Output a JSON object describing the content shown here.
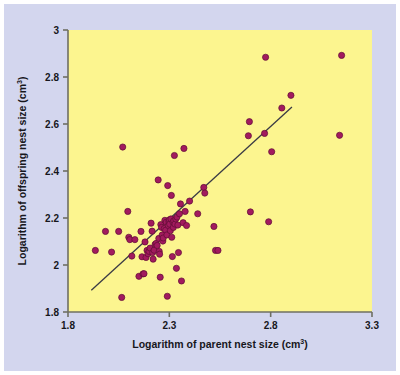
{
  "figure": {
    "background_color": "#ffffff",
    "panel_color": "#d3d6ee",
    "plot_background_color": "#fcf58f",
    "point_color": "#a21a5e",
    "point_edge_color": "#5e0d33",
    "line_color": "#3a3a44",
    "axis_color": "#6f6f62",
    "text_color": "#17171c"
  },
  "chart_data": {
    "type": "scatter",
    "title": "",
    "xlabel": "Logarithm of parent nest size (cm³)",
    "ylabel": "Logarithm of offspring nest size (cm³)",
    "xlabel_base": "Logarithm of parent nest size (cm",
    "xlabel_sup": "3",
    "xlabel_tail": ")",
    "ylabel_base": "Logarithm of offspring nest size (cm",
    "ylabel_sup": "3",
    "ylabel_tail": ")",
    "xlim": [
      1.8,
      3.3
    ],
    "ylim": [
      1.8,
      3.0
    ],
    "xticks": [
      1.8,
      2.3,
      2.8,
      3.3
    ],
    "xtick_labels": [
      "1.8",
      "2.3",
      "2.8",
      "3.3"
    ],
    "yticks": [
      1.8,
      2.0,
      2.2,
      2.4,
      2.6,
      2.8,
      3.0
    ],
    "ytick_labels": [
      "1.8",
      "2",
      "2.2",
      "2.4",
      "2.6",
      "2.8",
      "3"
    ],
    "grid": false,
    "legend": null,
    "marker": "circle",
    "marker_size_px": 5,
    "trendline": {
      "type": "linear-fit",
      "x_start": 1.915,
      "y_start": 1.893,
      "x_end": 2.905,
      "y_end": 2.672,
      "slope": 0.787,
      "intercept": 0.386
    },
    "points": [
      [
        1.935,
        2.062
      ],
      [
        1.985,
        2.143
      ],
      [
        2.015,
        2.055
      ],
      [
        2.05,
        2.143
      ],
      [
        2.065,
        1.862
      ],
      [
        2.07,
        2.502
      ],
      [
        2.095,
        2.228
      ],
      [
        2.1,
        2.118
      ],
      [
        2.105,
        2.108
      ],
      [
        2.115,
        2.038
      ],
      [
        2.13,
        2.108
      ],
      [
        2.15,
        1.952
      ],
      [
        2.16,
        2.143
      ],
      [
        2.165,
        2.035
      ],
      [
        2.17,
        1.962
      ],
      [
        2.175,
        1.963
      ],
      [
        2.18,
        2.098
      ],
      [
        2.185,
        2.032
      ],
      [
        2.19,
        2.062
      ],
      [
        2.195,
        2.048
      ],
      [
        2.2,
        2.058
      ],
      [
        2.205,
        2.072
      ],
      [
        2.21,
        2.178
      ],
      [
        2.215,
        2.144
      ],
      [
        2.218,
        2.053
      ],
      [
        2.22,
        2.025
      ],
      [
        2.225,
        2.063
      ],
      [
        2.23,
        2.088
      ],
      [
        2.235,
        2.092
      ],
      [
        2.24,
        2.083
      ],
      [
        2.245,
        2.362
      ],
      [
        2.248,
        2.113
      ],
      [
        2.25,
        2.058
      ],
      [
        2.252,
        2.046
      ],
      [
        2.255,
        1.948
      ],
      [
        2.258,
        2.172
      ],
      [
        2.262,
        2.16
      ],
      [
        2.265,
        2.128
      ],
      [
        2.268,
        2.102
      ],
      [
        2.27,
        2.115
      ],
      [
        2.275,
        2.155
      ],
      [
        2.278,
        2.19
      ],
      [
        2.282,
        2.148
      ],
      [
        2.285,
        2.182
      ],
      [
        2.288,
        2.128
      ],
      [
        2.29,
        1.867
      ],
      [
        2.292,
        2.338
      ],
      [
        2.295,
        2.168
      ],
      [
        2.298,
        2.186
      ],
      [
        2.3,
        2.192
      ],
      [
        2.302,
        2.174
      ],
      [
        2.305,
        2.146
      ],
      [
        2.308,
        2.196
      ],
      [
        2.31,
        2.296
      ],
      [
        2.312,
        2.118
      ],
      [
        2.315,
        2.036
      ],
      [
        2.318,
        2.182
      ],
      [
        2.32,
        2.16
      ],
      [
        2.322,
        2.188
      ],
      [
        2.325,
        2.466
      ],
      [
        2.328,
        2.174
      ],
      [
        2.332,
        2.196
      ],
      [
        2.335,
        1.986
      ],
      [
        2.338,
        2.204
      ],
      [
        2.342,
        2.17
      ],
      [
        2.345,
        2.053
      ],
      [
        2.35,
        2.218
      ],
      [
        2.355,
        2.26
      ],
      [
        2.36,
        1.932
      ],
      [
        2.368,
        2.18
      ],
      [
        2.372,
        2.496
      ],
      [
        2.378,
        2.228
      ],
      [
        2.385,
        2.168
      ],
      [
        2.4,
        2.272
      ],
      [
        2.44,
        2.218
      ],
      [
        2.47,
        2.33
      ],
      [
        2.475,
        2.306
      ],
      [
        2.52,
        2.164
      ],
      [
        2.528,
        2.062
      ],
      [
        2.54,
        2.062
      ],
      [
        2.69,
        2.55
      ],
      [
        2.695,
        2.61
      ],
      [
        2.7,
        2.226
      ],
      [
        2.77,
        2.56
      ],
      [
        2.775,
        2.884
      ],
      [
        2.79,
        2.184
      ],
      [
        2.805,
        2.482
      ],
      [
        2.855,
        2.668
      ],
      [
        2.9,
        2.722
      ],
      [
        3.14,
        2.552
      ],
      [
        3.15,
        2.892
      ]
    ]
  }
}
